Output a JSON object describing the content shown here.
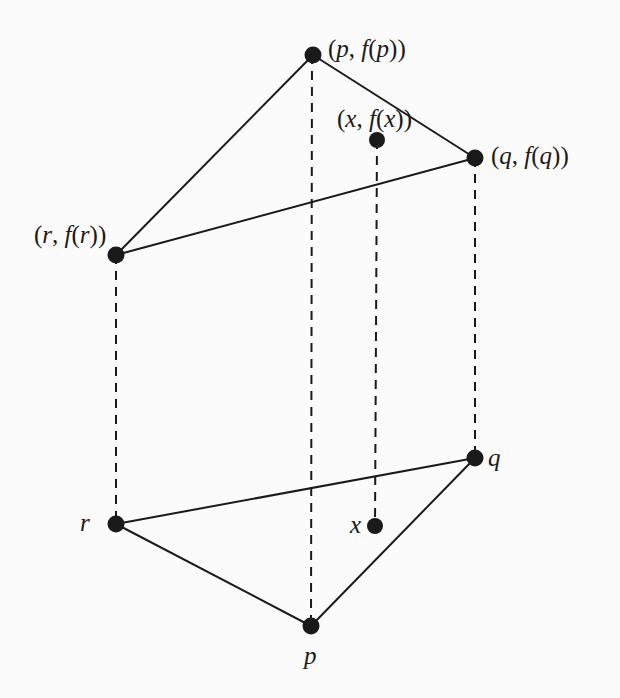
{
  "diagram": {
    "title": "",
    "colors": {
      "background": "#fbfbfb",
      "ink": "#1a1a1a"
    },
    "points": [
      {
        "id": "p_top",
        "x": 313,
        "y": 55,
        "label": "(p, f(p))",
        "label_parts": [
          "(",
          "p",
          ", ",
          "f",
          "(",
          "p",
          "))"
        ]
      },
      {
        "id": "x_top",
        "x": 377,
        "y": 140,
        "label": "(x, f(x))",
        "label_parts": [
          "(",
          "x",
          ", ",
          "f",
          "(",
          "x",
          "))"
        ]
      },
      {
        "id": "q_top",
        "x": 475,
        "y": 158,
        "label": "(q, f(q))",
        "label_parts": [
          "(",
          "q",
          ", ",
          "f",
          "(",
          "q",
          "))"
        ]
      },
      {
        "id": "r_top",
        "x": 116,
        "y": 255,
        "label": "(r, f(r))",
        "label_parts": [
          "(",
          "r",
          ", ",
          "f",
          "(",
          "r",
          "))"
        ]
      },
      {
        "id": "r_bot",
        "x": 116,
        "y": 524,
        "label": "r"
      },
      {
        "id": "x_bot",
        "x": 375,
        "y": 526,
        "label": "x"
      },
      {
        "id": "q_bot",
        "x": 475,
        "y": 458,
        "label": "q"
      },
      {
        "id": "p_bot",
        "x": 311,
        "y": 626,
        "label": "p"
      }
    ],
    "solid_edges": [
      [
        "r_top",
        "p_top"
      ],
      [
        "p_top",
        "q_top"
      ],
      [
        "q_top",
        "r_top"
      ],
      [
        "r_bot",
        "q_bot"
      ],
      [
        "q_bot",
        "p_bot"
      ],
      [
        "p_bot",
        "r_bot"
      ]
    ],
    "dashed_edges": [
      [
        "r_top",
        "r_bot"
      ],
      [
        "p_top",
        "p_bot"
      ],
      [
        "x_top",
        "x_bot"
      ],
      [
        "q_top",
        "q_bot"
      ]
    ]
  }
}
